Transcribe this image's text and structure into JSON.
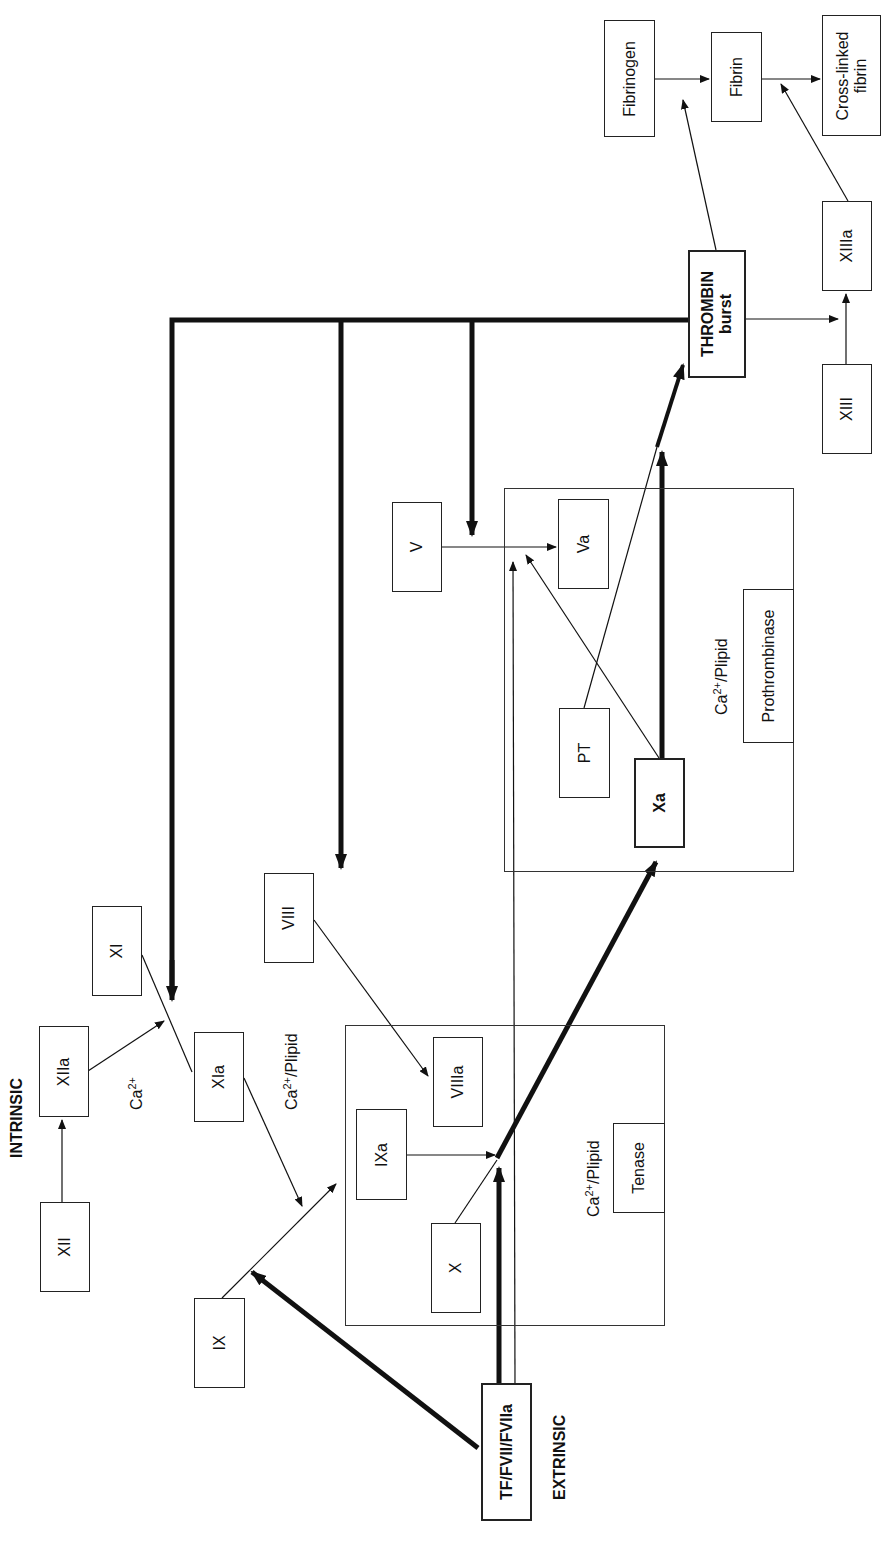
{
  "diagram": {
    "orientation": "rotated -90deg (read bottom-to-top)",
    "pathway_labels": {
      "intrinsic": "INTRINSIC",
      "extrinsic": "EXTRINSIC"
    },
    "cofactor_labels": {
      "ca_intrinsic": {
        "base": "Ca",
        "sup": "2+",
        "suffix": ""
      },
      "ca_plipid_xia": {
        "base": "Ca",
        "sup": "2+",
        "suffix": "/Plipid"
      },
      "ca_plipid_tenase": {
        "base": "Ca",
        "sup": "2+",
        "suffix": "/Plipid"
      },
      "ca_plipid_prothrombinase": {
        "base": "Ca",
        "sup": "2+",
        "suffix": "/Plipid"
      }
    },
    "nodes": {
      "xii": "XII",
      "xiia": "XIIa",
      "xi": "XI",
      "xia": "XIa",
      "ix": "IX",
      "ixa": "IXa",
      "viii": "VIII",
      "viiia": "VIIIa",
      "x": "X",
      "xa": "Xa",
      "v": "V",
      "va": "Va",
      "pt": "PT",
      "tf": "TF/FVII/FVIIa",
      "thrombin_line1": "THROMBIN",
      "thrombin_line2": "burst",
      "fibrinogen": "Fibrinogen",
      "fibrin": "Fibrin",
      "crosslinked_line1": "Cross-linked",
      "crosslinked_line2": "fibrin",
      "xiii": "XIII",
      "xiiia": "XIIIa"
    },
    "complexes": {
      "tenase": "Tenase",
      "prothrombinase": "Prothrombinase"
    },
    "edges": [
      {
        "from": "XII",
        "to": "XIIa",
        "weight": "thin"
      },
      {
        "from": "XIIa",
        "to": "XI→XIa",
        "weight": "thin"
      },
      {
        "from": "XIa",
        "to": "IX→IXa",
        "weight": "thin"
      },
      {
        "from": "TF/FVII/FVIIa",
        "to": "IX→IXa",
        "weight": "thick"
      },
      {
        "from": "IXa",
        "to": "X→Xa",
        "weight": "thin"
      },
      {
        "from": "TF/FVII/FVIIa",
        "to": "X→Xa",
        "weight": "thick"
      },
      {
        "from": "TF/FVII/FVIIa",
        "to": "V→Va",
        "weight": "thin"
      },
      {
        "from": "X",
        "to": "Xa",
        "weight": "thick"
      },
      {
        "from": "VIII",
        "to": "VIIIa",
        "weight": "thin"
      },
      {
        "from": "V",
        "to": "Va",
        "weight": "thin"
      },
      {
        "from": "Xa",
        "to": "V→Va",
        "weight": "thin"
      },
      {
        "from": "Xa",
        "to": "PT→THROMBIN",
        "weight": "thick"
      },
      {
        "from": "PT",
        "to": "THROMBIN burst",
        "weight": "thick"
      },
      {
        "from": "THROMBIN burst",
        "to": "XI→XIa",
        "weight": "thick"
      },
      {
        "from": "THROMBIN burst",
        "to": "VIII→VIIIa",
        "weight": "thick"
      },
      {
        "from": "THROMBIN burst",
        "to": "V→Va",
        "weight": "thick"
      },
      {
        "from": "THROMBIN burst",
        "to": "Fibrinogen→Fibrin",
        "weight": "thin"
      },
      {
        "from": "THROMBIN burst",
        "to": "XIII→XIIIa",
        "weight": "thin"
      },
      {
        "from": "XIII",
        "to": "XIIIa",
        "weight": "thin"
      },
      {
        "from": "Fibrinogen",
        "to": "Fibrin",
        "weight": "thin"
      },
      {
        "from": "Fibrin",
        "to": "Cross-linked fibrin",
        "weight": "thin"
      },
      {
        "from": "XIIIa",
        "to": "Fibrin→Cross-linked fibrin",
        "weight": "thin"
      }
    ]
  }
}
